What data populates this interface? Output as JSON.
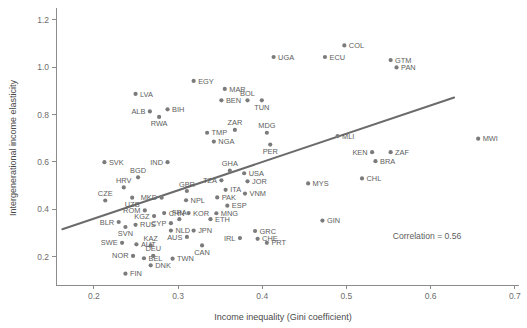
{
  "chart_data": {
    "type": "scatter",
    "title": "",
    "xlabel": "Income inequality (Gini coefficient)",
    "ylabel": "Intergenerational income elasticity",
    "xlim": [
      0.155,
      0.705
    ],
    "ylim": [
      0.08,
      1.25
    ],
    "xticks": [
      0.2,
      0.3,
      0.4,
      0.5,
      0.6,
      0.7
    ],
    "xticklabels": [
      "0.2",
      "0.3",
      "0.4",
      "0.5",
      "0.6",
      "0.7"
    ],
    "yticks": [
      0.2,
      0.4,
      0.6,
      0.8,
      1.0,
      1.2
    ],
    "yticklabels": [
      "0.2",
      "0.4",
      "0.6",
      "0.8",
      "1.0",
      "1.2"
    ],
    "grid": false,
    "legend": null,
    "annotations": [
      {
        "text": "Correlation = 0.56",
        "x": 0.555,
        "y": 0.275
      }
    ],
    "trendline": {
      "x0": 0.1625,
      "y0": 0.3155,
      "x1": 0.628,
      "y1": 0.872
    },
    "points": [
      {
        "label": "LVA",
        "x": 0.2495,
        "y": 0.887,
        "lpos": "r"
      },
      {
        "label": "EGY",
        "x": 0.3185,
        "y": 0.942,
        "lpos": "r"
      },
      {
        "label": "ALB",
        "x": 0.2665,
        "y": 0.813,
        "lpos": "l"
      },
      {
        "label": "BIH",
        "x": 0.2875,
        "y": 0.822,
        "lpos": "r"
      },
      {
        "label": "RWA",
        "x": 0.2775,
        "y": 0.79,
        "lpos": "b"
      },
      {
        "label": "COL",
        "x": 0.4975,
        "y": 1.092,
        "lpos": "r"
      },
      {
        "label": "UGA",
        "x": 0.4135,
        "y": 1.043,
        "lpos": "r"
      },
      {
        "label": "ECU",
        "x": 0.4745,
        "y": 1.043,
        "lpos": "r"
      },
      {
        "label": "GTM",
        "x": 0.5525,
        "y": 1.03,
        "lpos": "r"
      },
      {
        "label": "PAN",
        "x": 0.5595,
        "y": 0.999,
        "lpos": "r"
      },
      {
        "label": "MAR",
        "x": 0.3555,
        "y": 0.908,
        "lpos": "r"
      },
      {
        "label": "BOL",
        "x": 0.3825,
        "y": 0.86,
        "lpos": "t"
      },
      {
        "label": "BEN",
        "x": 0.3515,
        "y": 0.86,
        "lpos": "r"
      },
      {
        "label": "TUN",
        "x": 0.3995,
        "y": 0.86,
        "lpos": "b"
      },
      {
        "label": "ZAR",
        "x": 0.3675,
        "y": 0.735,
        "lpos": "t"
      },
      {
        "label": "TMP",
        "x": 0.3345,
        "y": 0.723,
        "lpos": "r"
      },
      {
        "label": "MDG",
        "x": 0.4055,
        "y": 0.723,
        "lpos": "t"
      },
      {
        "label": "MLI",
        "x": 0.4895,
        "y": 0.709,
        "lpos": "r"
      },
      {
        "label": "NGA",
        "x": 0.3425,
        "y": 0.686,
        "lpos": "r"
      },
      {
        "label": "PER",
        "x": 0.4095,
        "y": 0.673,
        "lpos": "b"
      },
      {
        "label": "MWI",
        "x": 0.6565,
        "y": 0.698,
        "lpos": "r"
      },
      {
        "label": "KEN",
        "x": 0.5305,
        "y": 0.641,
        "lpos": "l"
      },
      {
        "label": "ZAF",
        "x": 0.5525,
        "y": 0.641,
        "lpos": "r"
      },
      {
        "label": "BRA",
        "x": 0.5345,
        "y": 0.603,
        "lpos": "r"
      },
      {
        "label": "CHL",
        "x": 0.5185,
        "y": 0.53,
        "lpos": "r"
      },
      {
        "label": "MYS",
        "x": 0.4545,
        "y": 0.509,
        "lpos": "r"
      },
      {
        "label": "GIN",
        "x": 0.4715,
        "y": 0.352,
        "lpos": "r"
      },
      {
        "label": "SVK",
        "x": 0.2125,
        "y": 0.599,
        "lpos": "r"
      },
      {
        "label": "IND",
        "x": 0.2875,
        "y": 0.599,
        "lpos": "l"
      },
      {
        "label": "GHA",
        "x": 0.3615,
        "y": 0.563,
        "lpos": "t"
      },
      {
        "label": "BGD",
        "x": 0.2525,
        "y": 0.535,
        "lpos": "t"
      },
      {
        "label": "USA",
        "x": 0.3785,
        "y": 0.552,
        "lpos": "r"
      },
      {
        "label": "TZA",
        "x": 0.3515,
        "y": 0.522,
        "lpos": "l"
      },
      {
        "label": "JOR",
        "x": 0.3825,
        "y": 0.518,
        "lpos": "r"
      },
      {
        "label": "HRV",
        "x": 0.2355,
        "y": 0.492,
        "lpos": "t"
      },
      {
        "label": "GBR",
        "x": 0.3105,
        "y": 0.477,
        "lpos": "t"
      },
      {
        "label": "ITA",
        "x": 0.3565,
        "y": 0.482,
        "lpos": "r"
      },
      {
        "label": "VNM",
        "x": 0.3795,
        "y": 0.466,
        "lpos": "r"
      },
      {
        "label": "CZE",
        "x": 0.2135,
        "y": 0.437,
        "lpos": "t"
      },
      {
        "label": "UZB",
        "x": 0.2455,
        "y": 0.449,
        "lpos": "b"
      },
      {
        "label": "MKD",
        "x": 0.2805,
        "y": 0.449,
        "lpos": "l"
      },
      {
        "label": "NPL",
        "x": 0.3095,
        "y": 0.438,
        "lpos": "r"
      },
      {
        "label": "PAK",
        "x": 0.3465,
        "y": 0.45,
        "lpos": "r"
      },
      {
        "label": "ESP",
        "x": 0.3585,
        "y": 0.415,
        "lpos": "r"
      },
      {
        "label": "ROM",
        "x": 0.2605,
        "y": 0.395,
        "lpos": "l"
      },
      {
        "label": "KGZ",
        "x": 0.2715,
        "y": 0.371,
        "lpos": "l"
      },
      {
        "label": "CHN",
        "x": 0.2835,
        "y": 0.384,
        "lpos": "r"
      },
      {
        "label": "KOR",
        "x": 0.3125,
        "y": 0.384,
        "lpos": "r"
      },
      {
        "label": "MNG",
        "x": 0.3455,
        "y": 0.383,
        "lpos": "r"
      },
      {
        "label": "FRA",
        "x": 0.3015,
        "y": 0.358,
        "lpos": "t"
      },
      {
        "label": "ETH",
        "x": 0.3385,
        "y": 0.358,
        "lpos": "r"
      },
      {
        "label": "CYP",
        "x": 0.2915,
        "y": 0.341,
        "lpos": "l"
      },
      {
        "label": "BLR",
        "x": 0.2295,
        "y": 0.346,
        "lpos": "l"
      },
      {
        "label": "RUS",
        "x": 0.2495,
        "y": 0.334,
        "lpos": "r"
      },
      {
        "label": "SVN",
        "x": 0.2375,
        "y": 0.325,
        "lpos": "b"
      },
      {
        "label": "NLD",
        "x": 0.2915,
        "y": 0.31,
        "lpos": "r"
      },
      {
        "label": "JPN",
        "x": 0.3185,
        "y": 0.31,
        "lpos": "r"
      },
      {
        "label": "GRC",
        "x": 0.3915,
        "y": 0.308,
        "lpos": "r"
      },
      {
        "label": "AUS",
        "x": 0.3105,
        "y": 0.283,
        "lpos": "l"
      },
      {
        "label": "IRL",
        "x": 0.3735,
        "y": 0.278,
        "lpos": "l"
      },
      {
        "label": "CHE",
        "x": 0.3945,
        "y": 0.275,
        "lpos": "r"
      },
      {
        "label": "PRT",
        "x": 0.4055,
        "y": 0.258,
        "lpos": "r"
      },
      {
        "label": "SWE",
        "x": 0.2335,
        "y": 0.258,
        "lpos": "l"
      },
      {
        "label": "AUT",
        "x": 0.2505,
        "y": 0.252,
        "lpos": "r"
      },
      {
        "label": "KAZ",
        "x": 0.2675,
        "y": 0.247,
        "lpos": "t"
      },
      {
        "label": "CAN",
        "x": 0.3285,
        "y": 0.247,
        "lpos": "b"
      },
      {
        "label": "NOR",
        "x": 0.2465,
        "y": 0.203,
        "lpos": "l"
      },
      {
        "label": "BEL",
        "x": 0.2595,
        "y": 0.193,
        "lpos": "r"
      },
      {
        "label": "DEU",
        "x": 0.2705,
        "y": 0.203,
        "lpos": "t"
      },
      {
        "label": "TWN",
        "x": 0.2935,
        "y": 0.191,
        "lpos": "r"
      },
      {
        "label": "DNK",
        "x": 0.2675,
        "y": 0.163,
        "lpos": "r"
      },
      {
        "label": "FIN",
        "x": 0.2375,
        "y": 0.128,
        "lpos": "r"
      }
    ]
  }
}
